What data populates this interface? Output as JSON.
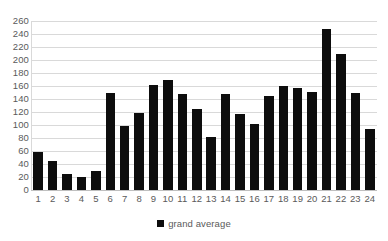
{
  "chart_data": {
    "type": "bar",
    "title": "",
    "subtitle": "",
    "xlabel": "",
    "ylabel": "",
    "categories": [
      "1",
      "2",
      "3",
      "4",
      "5",
      "6",
      "7",
      "8",
      "9",
      "10",
      "11",
      "12",
      "13",
      "14",
      "15",
      "16",
      "17",
      "18",
      "19",
      "20",
      "21",
      "22",
      "23",
      "24"
    ],
    "series": [
      {
        "name": "grand average",
        "color": "#0d0d0d",
        "values": [
          58,
          45,
          25,
          20,
          30,
          150,
          99,
          118,
          162,
          169,
          148,
          124,
          82,
          147,
          117,
          102,
          145,
          160,
          157,
          151,
          248,
          210,
          150,
          94
        ]
      }
    ],
    "ylim": [
      0,
      260
    ],
    "ytick_step": 20,
    "yticks": [
      "260",
      "240",
      "220",
      "200",
      "180",
      "160",
      "140",
      "120",
      "100",
      "80",
      "60",
      "40",
      "20",
      "0"
    ],
    "ytick_values": [
      260,
      240,
      220,
      200,
      180,
      160,
      140,
      120,
      100,
      80,
      60,
      40,
      20,
      0
    ],
    "grid": "horizontal",
    "grid_color": "#d9d9d9",
    "legend_position": "bottom",
    "legend": [
      {
        "label": "grand average",
        "color": "#0d0d0d",
        "marker": "square"
      }
    ],
    "annotations": [],
    "background": "#ffffff"
  }
}
